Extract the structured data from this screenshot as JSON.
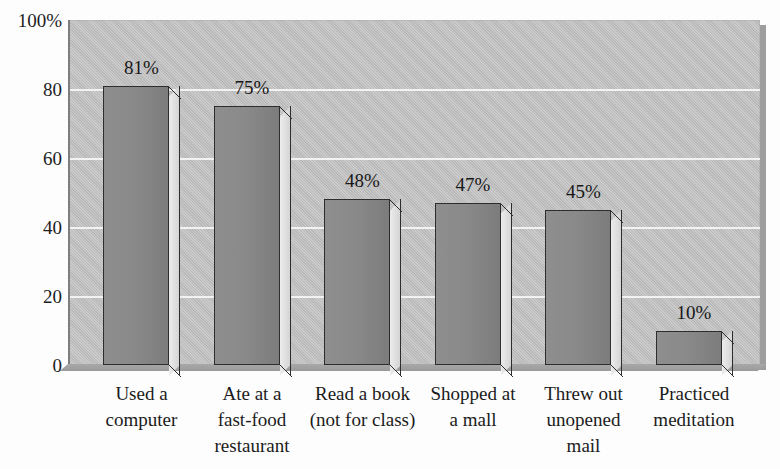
{
  "chart_data": {
    "type": "bar",
    "title": "",
    "title_fragment_visible": "•",
    "xlabel": "",
    "ylabel": "",
    "ylim": [
      0,
      100
    ],
    "grid": true,
    "legend": "none",
    "orientation": "vertical",
    "style": "3d-bar",
    "y_ticks": [
      "100%",
      "80",
      "60",
      "40",
      "20",
      "0"
    ],
    "y_tick_values": [
      100,
      80,
      60,
      40,
      20,
      0
    ],
    "categories": [
      "Used a computer",
      "Ate at a fast-food restaurant",
      "Read a book (not for class)",
      "Shopped at a mall",
      "Threw out unopened mail",
      "Practiced meditation"
    ],
    "category_lines": [
      [
        "Used a",
        "computer"
      ],
      [
        "Ate at a",
        "fast-food",
        "restaurant"
      ],
      [
        "Read a book",
        "(not for class)"
      ],
      [
        "Shopped at",
        "a mall"
      ],
      [
        "Threw out",
        "unopened",
        "mail"
      ],
      [
        "Practiced",
        "meditation"
      ]
    ],
    "values": [
      81,
      75,
      48,
      47,
      45,
      10
    ],
    "data_labels": [
      "81%",
      "75%",
      "48%",
      "47%",
      "45%",
      "10%"
    ],
    "colors": {
      "bar_front": "#8a8a8a",
      "bar_side": "#dedede",
      "bar_outline": "#2d2d2d",
      "plot_background": "#c3c3c3",
      "gridline": "#f2f2f2",
      "page_background": "#fdfdfd",
      "text": "#1a1a1a"
    }
  }
}
